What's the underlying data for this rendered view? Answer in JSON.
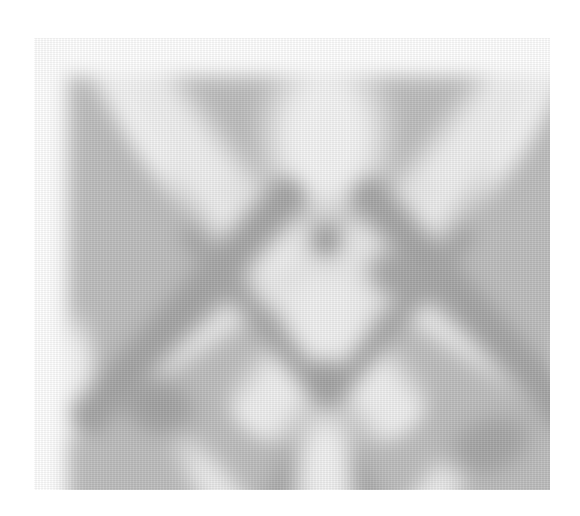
{
  "image": {
    "kind": "grayscale diffraction-like band pattern",
    "frame": {
      "x": 34,
      "y": 38,
      "width": 516,
      "height": 452
    },
    "colors": {
      "page_background": "#ffffff",
      "field": "#bdbdbd",
      "bright_band": "#f2f2f2",
      "dark_band": "#9c9c9c"
    },
    "bands": [
      {
        "type": "bright",
        "cx": 150,
        "cy": 110,
        "w": 90,
        "h": 620,
        "angle": -38,
        "color": "#efefef"
      },
      {
        "type": "bright",
        "cx": 370,
        "cy": 110,
        "w": 90,
        "h": 620,
        "angle": 38,
        "color": "#efefef"
      },
      {
        "type": "bright",
        "cx": 258,
        "cy": 60,
        "w": 150,
        "h": 200,
        "angle": 0,
        "color": "#f4f4f4"
      },
      {
        "type": "bright",
        "cx": 70,
        "cy": 50,
        "w": 40,
        "h": 200,
        "angle": -30,
        "color": "#f3f3f3"
      },
      {
        "type": "bright",
        "cx": 455,
        "cy": 50,
        "w": 40,
        "h": 200,
        "angle": 30,
        "color": "#f3f3f3"
      },
      {
        "type": "bright",
        "cx": 150,
        "cy": 250,
        "w": 36,
        "h": 520,
        "angle": 57,
        "color": "#e8e8e8"
      },
      {
        "type": "bright",
        "cx": 370,
        "cy": 250,
        "w": 36,
        "h": 520,
        "angle": -57,
        "color": "#e8e8e8"
      },
      {
        "type": "bright",
        "cx": 258,
        "cy": 400,
        "w": 70,
        "h": 170,
        "angle": 0,
        "color": "#f1f1f1"
      },
      {
        "type": "bright",
        "cx": 160,
        "cy": 430,
        "w": 50,
        "h": 200,
        "angle": -35,
        "color": "#ececec"
      },
      {
        "type": "bright",
        "cx": 360,
        "cy": 430,
        "w": 50,
        "h": 200,
        "angle": 35,
        "color": "#ececec"
      },
      {
        "type": "bright",
        "cx": 258,
        "cy": 240,
        "w": 60,
        "h": 90,
        "angle": 0,
        "color": "#f0f0f0"
      },
      {
        "type": "bright",
        "cx": 10,
        "cy": 300,
        "w": 40,
        "h": 140,
        "angle": 0,
        "color": "#f2f2f2"
      },
      {
        "type": "bright",
        "cx": 506,
        "cy": 300,
        "w": 40,
        "h": 140,
        "angle": 0,
        "color": "#eeeeee"
      },
      {
        "type": "dark",
        "cx": 120,
        "cy": 230,
        "w": 55,
        "h": 330,
        "angle": 42,
        "color": "#a3a3a3"
      },
      {
        "type": "dark",
        "cx": 400,
        "cy": 230,
        "w": 55,
        "h": 330,
        "angle": -42,
        "color": "#a3a3a3"
      },
      {
        "type": "dark",
        "cx": 190,
        "cy": 240,
        "w": 34,
        "h": 230,
        "angle": -40,
        "color": "#a7a7a7"
      },
      {
        "type": "dark",
        "cx": 330,
        "cy": 240,
        "w": 34,
        "h": 230,
        "angle": 40,
        "color": "#a7a7a7"
      },
      {
        "type": "dark",
        "cx": 258,
        "cy": 165,
        "w": 40,
        "h": 40,
        "angle": 0,
        "color": "#9e9e9e"
      },
      {
        "type": "dark",
        "cx": 258,
        "cy": 300,
        "w": 44,
        "h": 44,
        "angle": 0,
        "color": "#a0a0a0"
      },
      {
        "type": "dark",
        "cx": 90,
        "cy": 330,
        "w": 90,
        "h": 70,
        "angle": 20,
        "color": "#a2a2a2"
      },
      {
        "type": "dark",
        "cx": 420,
        "cy": 370,
        "w": 110,
        "h": 70,
        "angle": -20,
        "color": "#a5a5a5"
      },
      {
        "type": "dark",
        "cx": 210,
        "cy": 420,
        "w": 30,
        "h": 120,
        "angle": 15,
        "color": "#a8a8a8"
      },
      {
        "type": "dark",
        "cx": 300,
        "cy": 420,
        "w": 30,
        "h": 120,
        "angle": -15,
        "color": "#a8a8a8"
      },
      {
        "type": "dark",
        "cx": 330,
        "cy": 200,
        "w": 80,
        "h": 60,
        "angle": 30,
        "color": "#a6a6a6"
      }
    ]
  }
}
